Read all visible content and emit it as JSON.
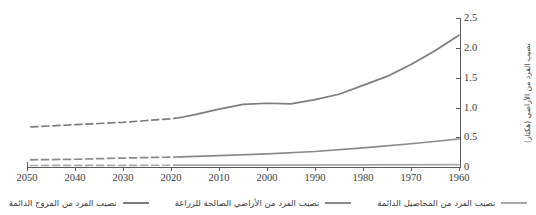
{
  "chart_data": {
    "type": "line",
    "title": "",
    "xlabel": "",
    "ylabel": "نصيب الفرد من الأراضي (هكتار)",
    "x_direction": "rtl-descending",
    "x": [
      1960,
      1970,
      1980,
      1990,
      2000,
      2010,
      2020,
      2030,
      2040,
      2050
    ],
    "xticklabels": [
      "2050",
      "2040",
      "2030",
      "2020",
      "2010",
      "2000",
      "1990",
      "1980",
      "1970",
      "1960"
    ],
    "yticklabels": [
      "2.5",
      "2.0",
      "1.5",
      "1.0",
      "0.5",
      "0"
    ],
    "ylim": [
      0,
      2.5
    ],
    "ytick_values": [
      2.5,
      2.0,
      1.5,
      1.0,
      0.5,
      0
    ],
    "grid": false,
    "legend_position": "bottom",
    "series": [
      {
        "name": "نصيب الفرد من المروج الدائمة",
        "color": "#7d7d7d",
        "historical": {
          "x": [
            1960,
            1965,
            1970,
            1975,
            1980,
            1985,
            1990,
            1995,
            2000,
            2005,
            2010,
            2015,
            2018
          ],
          "values": [
            2.21,
            1.95,
            1.72,
            1.52,
            1.37,
            1.22,
            1.13,
            1.06,
            1.07,
            1.05,
            0.97,
            0.88,
            0.83
          ]
        },
        "projected": {
          "x": [
            2018,
            2020,
            2025,
            2030,
            2035,
            2040,
            2045,
            2050
          ],
          "values": [
            0.83,
            0.81,
            0.78,
            0.75,
            0.73,
            0.71,
            0.69,
            0.67
          ]
        }
      },
      {
        "name": "نصيب الفرد من الأراضي الصالحة للزراعة",
        "color": "#8a8a8a",
        "historical": {
          "x": [
            1960,
            1970,
            1980,
            1990,
            2000,
            2010,
            2018
          ],
          "values": [
            0.47,
            0.39,
            0.32,
            0.26,
            0.22,
            0.19,
            0.17
          ]
        },
        "projected": {
          "x": [
            2018,
            2030,
            2040,
            2050
          ],
          "values": [
            0.17,
            0.15,
            0.13,
            0.12
          ]
        }
      },
      {
        "name": "نصيب الفرد من المحاصيل الدائمة",
        "color": "#a8a8a8",
        "historical": {
          "x": [
            1960,
            1980,
            2000,
            2018
          ],
          "values": [
            0.04,
            0.035,
            0.032,
            0.03
          ]
        },
        "projected": {
          "x": [
            2018,
            2050
          ],
          "values": [
            0.03,
            0.025
          ]
        }
      }
    ]
  },
  "axis": {
    "y_title": "نصيب الفرد من الأراضي (هكتار)",
    "xticks": [
      "2050",
      "2040",
      "2030",
      "2020",
      "2010",
      "2000",
      "1990",
      "1980",
      "1970",
      "1960"
    ],
    "yticks": [
      "2.5",
      "2.0",
      "1.5",
      "1.0",
      "0.5",
      "0"
    ]
  },
  "legend": {
    "items": [
      {
        "label": "نصيب الفرد من المروج الدائمة",
        "color": "#7d7d7d"
      },
      {
        "label": "نصيب الفرد من الأراضي الصالحة للزراعة",
        "color": "#8a8a8a"
      },
      {
        "label": "نصيب الفرد من المحاصيل الدائمة",
        "color": "#a8a8a8"
      }
    ]
  }
}
